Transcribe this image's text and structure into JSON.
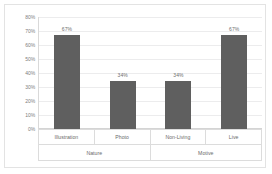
{
  "chart_data": {
    "type": "bar",
    "title": "",
    "xlabel": "",
    "ylabel": "",
    "categories": [
      "Illustration",
      "Photo",
      "Non-Living",
      "Live"
    ],
    "values": [
      67,
      34,
      34,
      67
    ],
    "data_labels": [
      "67%",
      "34%",
      "34%",
      "67%"
    ],
    "groups": [
      {
        "label": "Nature",
        "categories": [
          "Illustration",
          "Photo"
        ]
      },
      {
        "label": "Motive",
        "categories": [
          "Non-Living",
          "Live"
        ]
      }
    ],
    "ylim": [
      0,
      80
    ],
    "ytick_values": [
      0,
      10,
      20,
      30,
      40,
      50,
      60,
      70,
      80
    ],
    "ytick_labels": [
      "0%",
      "10%",
      "20%",
      "30%",
      "40%",
      "50%",
      "60%",
      "70%",
      "80%"
    ],
    "grid": true,
    "legend": "none",
    "bar_color": "#5f5f5f",
    "gridline_color": "#ececed",
    "axis_text_color": "#7d7d7d",
    "frame_color": "#e3e3e3",
    "background_color": "#ffffff"
  }
}
